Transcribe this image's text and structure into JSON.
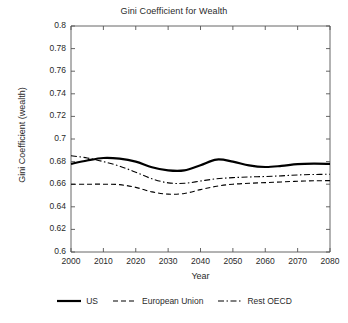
{
  "chart_data": {
    "type": "line",
    "title": "Gini Coefficient for Wealth",
    "xlabel": "Year",
    "ylabel": "Gini Coefficient (wealth)",
    "xlim": [
      2000,
      2080
    ],
    "ylim": [
      0.6,
      0.8
    ],
    "grid": false,
    "legend_position": "bottom",
    "xticks": [
      2000,
      2010,
      2020,
      2030,
      2040,
      2050,
      2060,
      2070,
      2080
    ],
    "xtick_labels": [
      "2000",
      "2010",
      "2020",
      "2030",
      "2040",
      "2050",
      "2060",
      "2070",
      "2080"
    ],
    "yticks": [
      0.6,
      0.62,
      0.64,
      0.66,
      0.68,
      0.7,
      0.72,
      0.74,
      0.76,
      0.78,
      0.8
    ],
    "ytick_labels": [
      "0.6",
      "0.62",
      "0.64",
      "0.66",
      "0.68",
      "0.7",
      "0.72",
      "0.74",
      "0.76",
      "0.78",
      "0.8"
    ],
    "x": [
      2000,
      2005,
      2010,
      2015,
      2020,
      2025,
      2030,
      2035,
      2040,
      2045,
      2050,
      2055,
      2060,
      2065,
      2070,
      2075,
      2080
    ],
    "series": [
      {
        "name": "US",
        "style": "solid",
        "color": "#000000",
        "width": 2.2,
        "values": [
          0.678,
          0.681,
          0.6832,
          0.6826,
          0.68,
          0.675,
          0.6722,
          0.6722,
          0.6768,
          0.6818,
          0.68,
          0.6766,
          0.6752,
          0.6762,
          0.6778,
          0.6782,
          0.678
        ]
      },
      {
        "name": "European Union",
        "style": "dashed",
        "color": "#000000",
        "width": 1.1,
        "values": [
          0.66,
          0.66,
          0.66,
          0.6596,
          0.6572,
          0.6532,
          0.6512,
          0.6518,
          0.6552,
          0.6582,
          0.66,
          0.6608,
          0.6614,
          0.662,
          0.6626,
          0.663,
          0.6632
        ]
      },
      {
        "name": "Rest OECD",
        "style": "dashdot",
        "color": "#000000",
        "width": 1.1,
        "values": [
          0.6852,
          0.6832,
          0.68,
          0.676,
          0.6706,
          0.6648,
          0.6612,
          0.6608,
          0.6628,
          0.6648,
          0.6658,
          0.6664,
          0.6668,
          0.6674,
          0.6682,
          0.6686,
          0.6688
        ]
      }
    ]
  },
  "legend": {
    "items": [
      {
        "label": "US"
      },
      {
        "label": "European Union"
      },
      {
        "label": "Rest OECD"
      }
    ]
  }
}
